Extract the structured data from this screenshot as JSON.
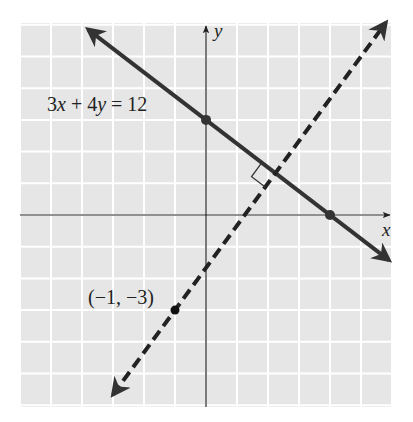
{
  "chart_data": {
    "type": "line",
    "title": "",
    "xlabel": "x",
    "ylabel": "y",
    "xlim": [
      -6,
      6
    ],
    "ylim": [
      -6,
      6
    ],
    "grid": true,
    "grid_step": 1,
    "tick_labels_shown": false,
    "series": [
      {
        "name": "3x + 4y = 12",
        "style": "solid",
        "equation": "3x + 4y = 12",
        "slope": -0.75,
        "intercept": 3,
        "marked_points": [
          [
            0,
            3
          ],
          [
            4,
            0
          ]
        ],
        "arrows": "both"
      },
      {
        "name": "perpendicular through (-1, -3)",
        "style": "dashed",
        "slope": 1.3333,
        "intercept": -1.6667,
        "marked_points": [
          [
            -1,
            -3
          ]
        ],
        "arrows": "both"
      }
    ],
    "annotations": [
      {
        "text": "3x + 4y = 12",
        "at": [
          -3.8,
          2.6
        ]
      },
      {
        "text": "(−1, −3)",
        "at": [
          -3.7,
          -2.6
        ]
      },
      {
        "type": "right-angle-marker",
        "at": [
          2.24,
          1.32
        ]
      }
    ]
  },
  "labels": {
    "x_axis": "x",
    "y_axis": "y",
    "line1_label_num": "3",
    "line1_label_x": "x",
    "line1_label_mid": " + 4",
    "line1_label_y": "y",
    "line1_label_end": " = 12",
    "point_label": "(−1, −3)"
  },
  "colors": {
    "grid_background": "#e6e6e6",
    "grid_lines": "#ffffff",
    "lines": "#333333",
    "axes": "#222222"
  }
}
